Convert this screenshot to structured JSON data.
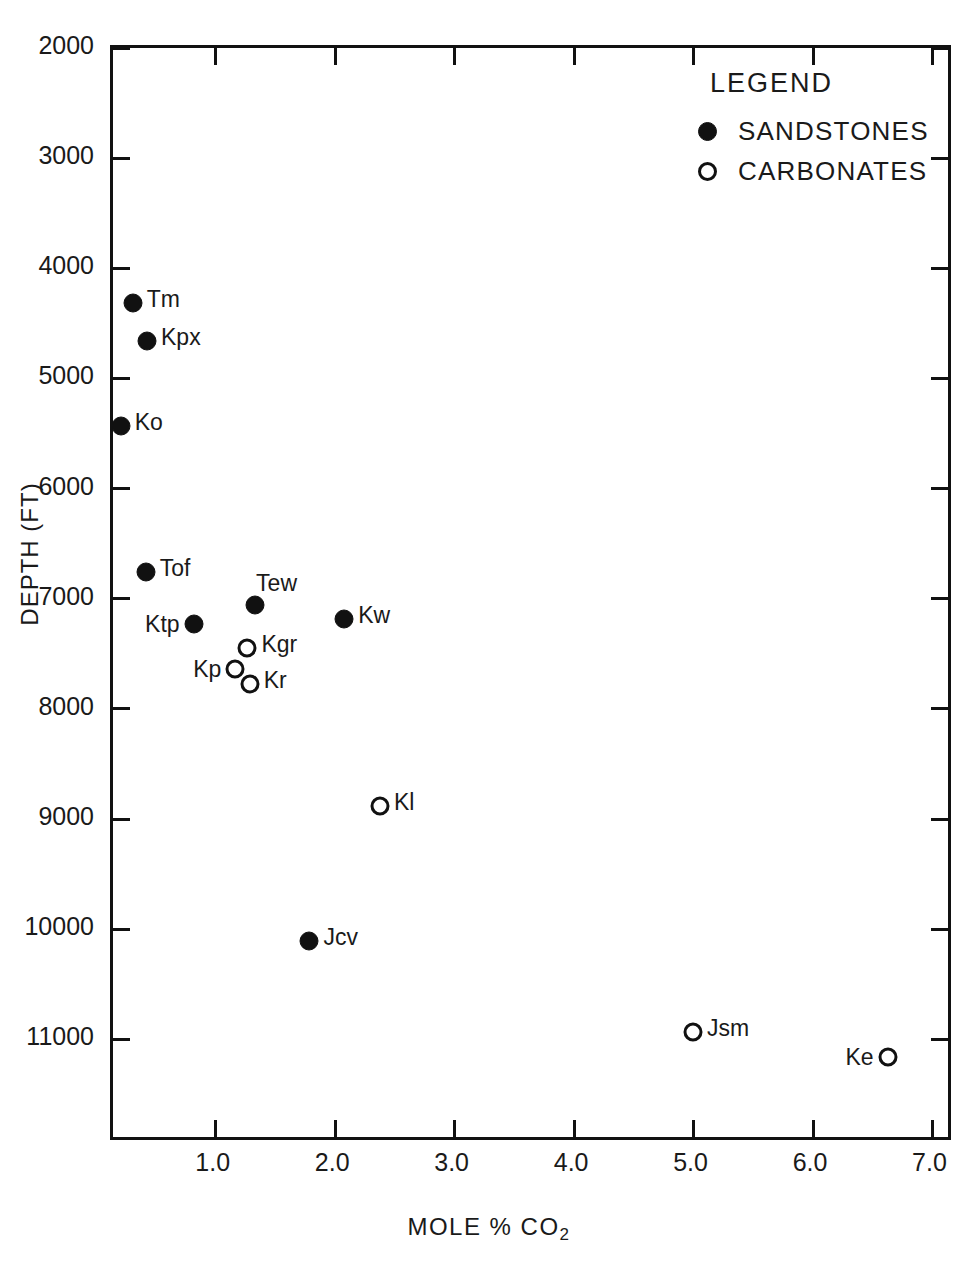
{
  "chart_data": {
    "type": "scatter",
    "title": "",
    "xlabel": "MOLE % CO2",
    "xlabel_prefix": "MOLE  %  CO",
    "xlabel_subscript": "2",
    "ylabel": "DEPTH (FT)",
    "xlim": [
      0.14,
      7.18
    ],
    "ylim": [
      2000,
      11940
    ],
    "y_inverted": true,
    "grid": false,
    "xticks": [
      "1.0",
      "2.0",
      "3.0",
      "4.0",
      "5.0",
      "6.0",
      "7.0"
    ],
    "xtick_values": [
      1.0,
      2.0,
      3.0,
      4.0,
      5.0,
      6.0,
      7.0
    ],
    "yticks": [
      "2000",
      "3000",
      "4000",
      "5000",
      "6000",
      "7000",
      "8000",
      "9000",
      "10000",
      "11000"
    ],
    "ytick_values": [
      2000,
      3000,
      4000,
      5000,
      6000,
      7000,
      8000,
      9000,
      10000,
      11000
    ],
    "series": [
      {
        "name": "SANDSTONES",
        "marker": "filled-circle",
        "color": "#111111",
        "points": [
          {
            "label": "Tm",
            "x": 0.33,
            "y": 4340,
            "label_pos": "right"
          },
          {
            "label": "Kpx",
            "x": 0.45,
            "y": 4690,
            "label_pos": "right"
          },
          {
            "label": "Ko",
            "x": 0.23,
            "y": 5460,
            "label_pos": "right"
          },
          {
            "label": "Tof",
            "x": 0.44,
            "y": 6780,
            "label_pos": "right"
          },
          {
            "label": "Tew",
            "x": 1.35,
            "y": 7080,
            "label_pos": "above"
          },
          {
            "label": "Ktp",
            "x": 0.84,
            "y": 7260,
            "label_pos": "left"
          },
          {
            "label": "Kw",
            "x": 2.1,
            "y": 7210,
            "label_pos": "right"
          },
          {
            "label": "Jcv",
            "x": 1.81,
            "y": 10130,
            "label_pos": "right"
          }
        ]
      },
      {
        "name": "CARBONATES",
        "marker": "open-circle",
        "color": "#111111",
        "points": [
          {
            "label": "Kgr",
            "x": 1.29,
            "y": 7470,
            "label_pos": "right"
          },
          {
            "label": "Kp",
            "x": 1.19,
            "y": 7660,
            "label_pos": "left"
          },
          {
            "label": "Kr",
            "x": 1.31,
            "y": 7800,
            "label_pos": "right"
          },
          {
            "label": "Kl",
            "x": 2.4,
            "y": 8910,
            "label_pos": "right"
          },
          {
            "label": "Jsm",
            "x": 5.02,
            "y": 10960,
            "label_pos": "right"
          },
          {
            "label": "Ke",
            "x": 6.65,
            "y": 11190,
            "label_pos": "left"
          }
        ]
      }
    ],
    "legend": {
      "position": "top-right",
      "title": "LEGEND",
      "entries": [
        {
          "marker": "filled-circle",
          "label": "SANDSTONES"
        },
        {
          "marker": "open-circle",
          "label": "CARBONATES"
        }
      ]
    }
  }
}
